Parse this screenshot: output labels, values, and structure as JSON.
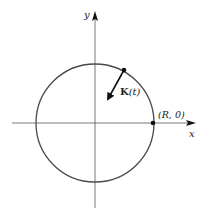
{
  "diagram": {
    "axes": {
      "x_label": "x",
      "y_label": "y"
    },
    "circle": {
      "description": "circle of radius R centered at origin"
    },
    "vector": {
      "label_bold": "K",
      "label_arg": "(t)"
    },
    "point": {
      "label": "(R, 0)"
    },
    "colors": {
      "curve": "#4a4a4a",
      "axis": "#555555",
      "ink": "#111111"
    }
  }
}
